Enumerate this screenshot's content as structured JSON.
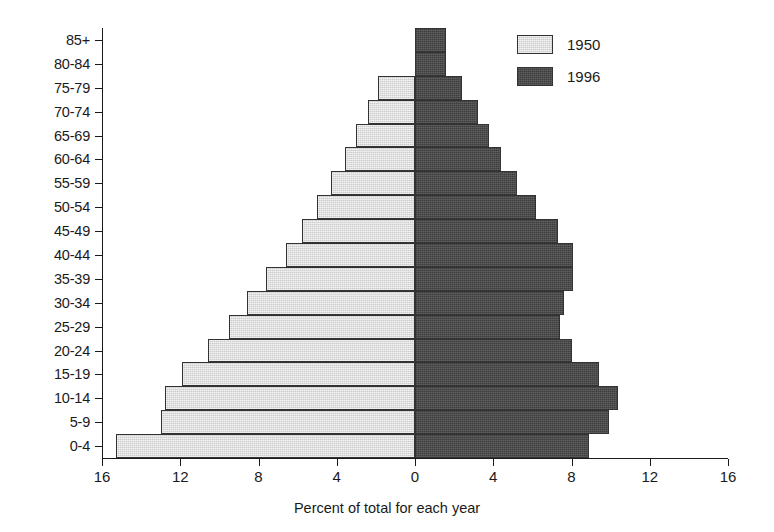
{
  "chart_data": {
    "type": "bar",
    "subtype": "population-pyramid",
    "title": "",
    "xlabel": "Percent of total for each year",
    "ylabel": "",
    "categories": [
      "0-4",
      "5-9",
      "10-14",
      "15-19",
      "20-24",
      "25-29",
      "30-34",
      "35-39",
      "40-44",
      "45-49",
      "50-54",
      "55-59",
      "60-64",
      "65-69",
      "70-74",
      "75-79",
      "80-84",
      "85+"
    ],
    "xlim": [
      -16,
      16
    ],
    "xticks": [
      -16,
      -12,
      -8,
      -4,
      0,
      4,
      8,
      12,
      16
    ],
    "xtick_labels": [
      "16",
      "12",
      "8",
      "4",
      "0",
      "4",
      "8",
      "12",
      "16"
    ],
    "grid": false,
    "legend_position": "top-right",
    "series": [
      {
        "name": "1950",
        "side": "left",
        "color": "#cdcdcd",
        "values": [
          15.3,
          13.0,
          12.8,
          11.9,
          10.6,
          9.5,
          8.6,
          7.6,
          6.6,
          5.8,
          5.0,
          4.3,
          3.6,
          3.0,
          2.4,
          1.9,
          0.0,
          0.0
        ]
      },
      {
        "name": "1996",
        "side": "right",
        "color": "#4c4c4c",
        "values": [
          8.9,
          9.9,
          10.4,
          9.4,
          8.0,
          7.4,
          7.6,
          8.1,
          8.1,
          7.3,
          6.2,
          5.2,
          4.4,
          3.8,
          3.2,
          2.4,
          1.6,
          1.6
        ]
      }
    ],
    "axis_tick_labels_y": [
      "85+",
      "80-84",
      "75-79",
      "70-74",
      "65-69",
      "60-64",
      "55-59",
      "50-54",
      "45-49",
      "40-44",
      "35-39",
      "30-34",
      "25-29",
      "20-24",
      "15-19",
      "10-14",
      "5-9",
      "0-4"
    ]
  },
  "legend": {
    "entries": [
      {
        "label": "1950",
        "swatch": "light-gray-swatch"
      },
      {
        "label": "1996",
        "swatch": "dark-gray-swatch"
      }
    ]
  },
  "axis": {
    "x_title": "Percent of total for each year"
  },
  "colors": {
    "series_1950": "#cdcdcd",
    "series_1996": "#4c4c4c",
    "axis": "#1a1a1a",
    "background": "#ffffff"
  }
}
